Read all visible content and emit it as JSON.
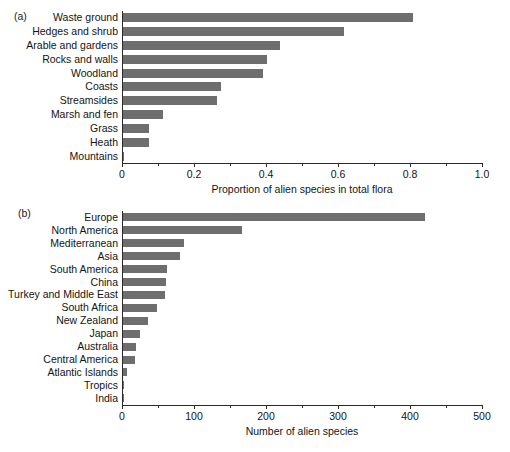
{
  "figure": {
    "background": "#ffffff",
    "bar_color": "#6e6e6e",
    "axis_color": "#2b2b2b"
  },
  "panels": {
    "a": {
      "tag": "(a)"
    },
    "b": {
      "tag": "(b)"
    }
  },
  "chart_data": [
    {
      "type": "bar",
      "orientation": "horizontal",
      "panel": "(a)",
      "title": "",
      "xlabel": "Proportion of alien species in total flora",
      "ylabel": "",
      "xlim": [
        0,
        1.0
      ],
      "grid": false,
      "legend": null,
      "xticks": [
        "0",
        "0.2",
        "0.4",
        "0.6",
        "0.8",
        "1.0"
      ],
      "xtick_values": [
        0,
        0.2,
        0.4,
        0.6,
        0.8,
        1.0
      ],
      "minor_tick_values": [
        0.1,
        0.3,
        0.5,
        0.7,
        0.9
      ],
      "categories": [
        "Waste ground",
        "Hedges and shrub",
        "Arable and gardens",
        "Rocks and walls",
        "Woodland",
        "Coasts",
        "Streamsides",
        "Marsh and fen",
        "Grass",
        "Heath",
        "Mountains"
      ],
      "values": [
        0.805,
        0.615,
        0.435,
        0.4,
        0.388,
        0.272,
        0.26,
        0.11,
        0.072,
        0.072,
        0.003
      ]
    },
    {
      "type": "bar",
      "orientation": "horizontal",
      "panel": "(b)",
      "title": "",
      "xlabel": "Number of alien species",
      "ylabel": "",
      "xlim": [
        0,
        500
      ],
      "grid": false,
      "legend": null,
      "xticks": [
        "0",
        "100",
        "200",
        "300",
        "400",
        "500"
      ],
      "xtick_values": [
        0,
        100,
        200,
        300,
        400,
        500
      ],
      "minor_tick_values": [
        50,
        150,
        250,
        350,
        450
      ],
      "categories": [
        "Europe",
        "North America",
        "Mediterranean",
        "Asia",
        "South America",
        "China",
        "Turkey and Middle East",
        "South Africa",
        "New Zealand",
        "Japan",
        "Australia",
        "Central America",
        "Atlantic Islands",
        "Tropics",
        "India"
      ],
      "values": [
        420,
        165,
        85,
        79,
        61,
        60,
        59,
        47,
        35,
        24,
        18,
        16,
        6,
        1,
        1
      ]
    }
  ]
}
